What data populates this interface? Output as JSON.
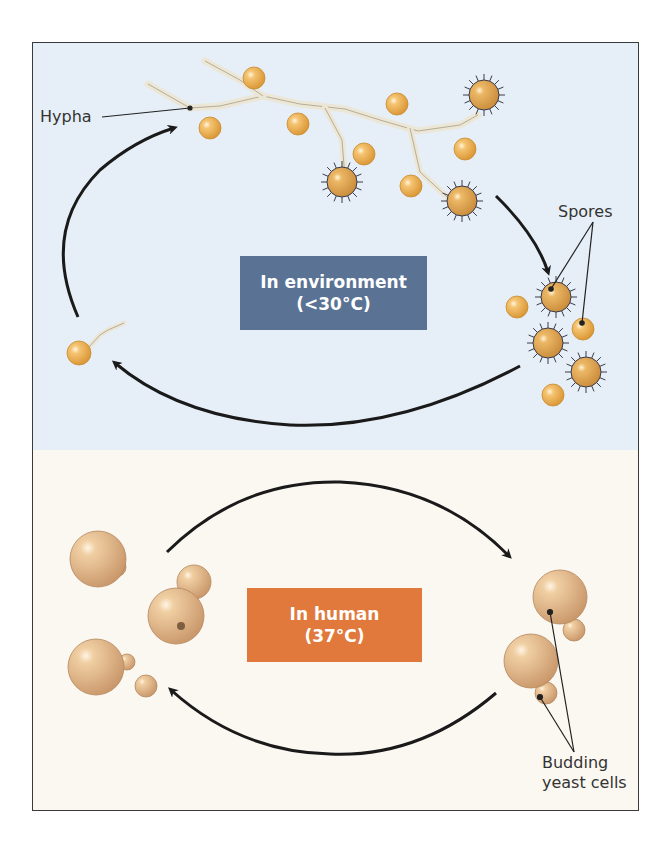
{
  "diagram": {
    "type": "life-cycle",
    "sections": [
      {
        "id": "environment",
        "title": "In environment",
        "condition": "(<30°C)",
        "background_color": "#e6eff7",
        "box_color": "#5a7294",
        "labels": {
          "hypha": "Hypha",
          "spores": "Spores"
        },
        "stages": [
          "hypha with spores",
          "released spores",
          "germinating spore"
        ]
      },
      {
        "id": "human",
        "title": "In human",
        "condition": "(37°C)",
        "background_color": "#fbf8f1",
        "box_color": "#e0793b",
        "labels": {
          "budding_yeast": "Budding yeast cells"
        },
        "label_lines": [
          "Budding",
          "yeast cells"
        ],
        "stages": [
          "yeast cells",
          "budding yeast cells"
        ]
      }
    ],
    "colors": {
      "arrow": "#1a1a1a",
      "spore_fill": "#efb45a",
      "spiny_spore_fill": "#e4ae5b",
      "hypha_fill": "#f1ece0",
      "yeast_fill": "#e9c396",
      "frame_border": "#3a3a3a"
    }
  }
}
